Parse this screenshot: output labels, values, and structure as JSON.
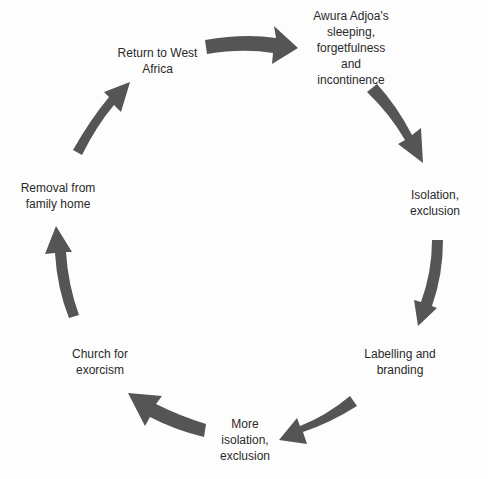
{
  "diagram": {
    "type": "cycle",
    "arrow_color": "#555555",
    "nodes": [
      {
        "id": "n1",
        "label": "Awura Adjoa's\nsleeping,\nforgetfulness\nand\nincontinence"
      },
      {
        "id": "n2",
        "label": "Isolation,\nexclusion"
      },
      {
        "id": "n3",
        "label": "Labelling and\nbranding"
      },
      {
        "id": "n4",
        "label": "More\nisolation,\nexclusion"
      },
      {
        "id": "n5",
        "label": "Church for\nexorcism"
      },
      {
        "id": "n6",
        "label": "Removal from\nfamily home"
      },
      {
        "id": "n7",
        "label": "Return to West\nAfrica"
      }
    ],
    "edges": [
      {
        "from": "n1",
        "to": "n2"
      },
      {
        "from": "n2",
        "to": "n3"
      },
      {
        "from": "n3",
        "to": "n4"
      },
      {
        "from": "n4",
        "to": "n5"
      },
      {
        "from": "n5",
        "to": "n6"
      },
      {
        "from": "n6",
        "to": "n7"
      },
      {
        "from": "n7",
        "to": "n1"
      }
    ]
  }
}
